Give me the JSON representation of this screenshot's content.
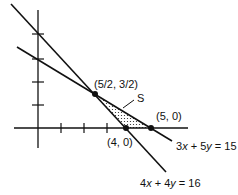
{
  "diagram": {
    "type": "linear-programming-feasible-region",
    "axes": {
      "x_ticks": [
        1,
        2,
        3,
        4,
        5
      ],
      "y_ticks": [
        1,
        2,
        3,
        4
      ]
    },
    "lines": [
      {
        "equation": "4x + 4y = 16",
        "label_parts": [
          "4",
          "x",
          " + 4",
          "y",
          " = 16"
        ]
      },
      {
        "equation": "3x + 5y = 15",
        "label_parts": [
          "3",
          "x",
          " + 5",
          "y",
          " = 15"
        ]
      }
    ],
    "points": [
      {
        "label": "(5/2, 3/2)",
        "x": 2.5,
        "y": 1.5
      },
      {
        "label": "(4, 0)",
        "x": 4,
        "y": 0
      },
      {
        "label": "(5, 0)",
        "x": 5,
        "y": 0
      }
    ],
    "region": {
      "label": "S",
      "fill": "dotted"
    },
    "colors": {
      "stroke": "#111111",
      "background": "#ffffff"
    }
  }
}
